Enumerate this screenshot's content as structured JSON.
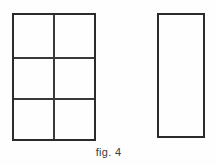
{
  "figure": {
    "caption": "fig. 4",
    "background_color": "#fefefe",
    "line_color": "#2b2b2b",
    "divider_color": "#3a3a3a",
    "shapes": [
      {
        "name": "subdivided-rectangle",
        "type": "rectangle",
        "columns": 2,
        "rows": 3,
        "x": 12,
        "y": 13,
        "width": 84,
        "height": 128,
        "vertical_dividers": [
          39
        ],
        "horizontal_dividers": [
          42,
          83
        ],
        "fill": "none",
        "stroke_width": 2
      },
      {
        "name": "plain-rectangle",
        "type": "rectangle",
        "columns": 1,
        "rows": 1,
        "x": 157,
        "y": 13,
        "width": 48,
        "height": 125,
        "vertical_dividers": [],
        "horizontal_dividers": [],
        "fill": "none",
        "stroke_width": 2
      }
    ]
  }
}
